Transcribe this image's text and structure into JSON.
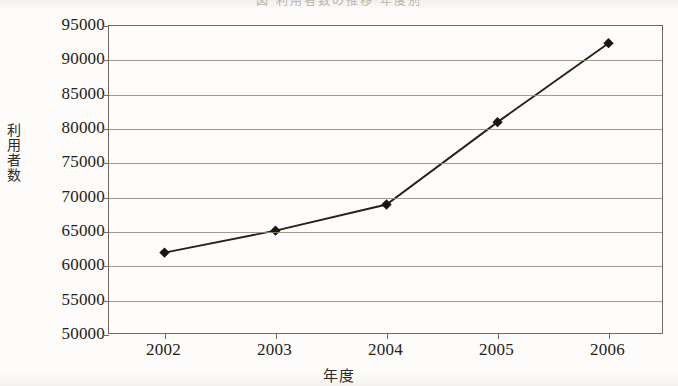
{
  "header": {
    "cropped_text": "図 利用者数の推移 年度別"
  },
  "axes": {
    "y_title": "利用者数",
    "y_title_chars": [
      "利",
      "用",
      "者",
      "数"
    ],
    "x_title": "年度"
  },
  "chart_data": {
    "type": "line",
    "title": "",
    "xlabel": "年度",
    "ylabel": "利用者数",
    "categories": [
      "2002",
      "2003",
      "2004",
      "2005",
      "2006"
    ],
    "values": [
      62000,
      65200,
      69000,
      81000,
      92500
    ],
    "series": [
      {
        "name": "利用者数",
        "values": [
          62000,
          65200,
          69000,
          81000,
          92500
        ]
      }
    ],
    "ylim": [
      50000,
      95000
    ],
    "ytick_step": 5000,
    "yticks": [
      50000,
      55000,
      60000,
      65000,
      70000,
      75000,
      80000,
      85000,
      90000,
      95000
    ],
    "ytick_labels": [
      "50000",
      "55000",
      "60000",
      "65000",
      "70000",
      "75000",
      "80000",
      "85000",
      "90000",
      "95000"
    ],
    "grid": true,
    "grid_axis": "y",
    "legend": false,
    "legend_position": "none",
    "marker": "diamond",
    "line_color": "#2a2018",
    "marker_color": "#1d150f",
    "grid_color": "#8d897f",
    "frame_color": "#6e6a61",
    "plot_background": "#fefdfb",
    "page_background": "#fbfaf8"
  }
}
